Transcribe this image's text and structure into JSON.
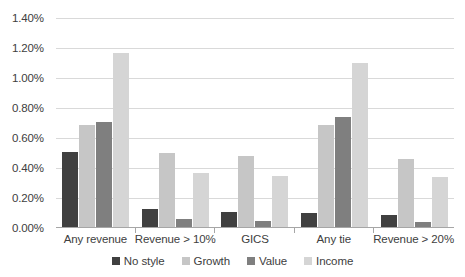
{
  "chart_data": {
    "type": "bar",
    "title": "",
    "subtitle": "",
    "xlabel": "",
    "ylabel": "",
    "grid": true,
    "legend_position": "bottom",
    "ylim": [
      0,
      1.4
    ],
    "ytick_labels": [
      "0.00%",
      "0.20%",
      "0.40%",
      "0.60%",
      "0.80%",
      "1.00%",
      "1.20%",
      "1.40%"
    ],
    "ytick_values": [
      0.0,
      0.2,
      0.4,
      0.6,
      0.8,
      1.0,
      1.2,
      1.4
    ],
    "value_unit": "%",
    "categories": [
      "Any revenue",
      "Revenue > 10%",
      "GICS",
      "Any tie",
      "Revenue > 20%"
    ],
    "series": [
      {
        "name": "No style",
        "color": "#404040",
        "values": [
          0.51,
          0.13,
          0.11,
          0.1,
          0.09
        ]
      },
      {
        "name": "Growth",
        "color": "#c6c6c6",
        "values": [
          0.69,
          0.5,
          0.48,
          0.69,
          0.46
        ]
      },
      {
        "name": "Value",
        "color": "#7f7f7f",
        "values": [
          0.71,
          0.06,
          0.05,
          0.74,
          0.04
        ]
      },
      {
        "name": "Income",
        "color": "#d5d5d5",
        "values": [
          1.17,
          0.37,
          0.35,
          1.1,
          0.34
        ]
      }
    ]
  }
}
